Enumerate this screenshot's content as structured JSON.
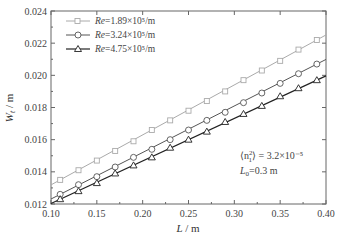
{
  "chart_data": {
    "type": "line",
    "title": "",
    "xlabel": "L / m",
    "ylabel": "W_t / m",
    "xlim": [
      0.1,
      0.4
    ],
    "ylim": [
      0.012,
      0.024
    ],
    "xticks": [
      0.1,
      0.15,
      0.2,
      0.25,
      0.3,
      0.35,
      0.4
    ],
    "xtick_labels": [
      "0.10",
      "0.15",
      "0.20",
      "0.25",
      "0.30",
      "0.35",
      "0.40"
    ],
    "yticks": [
      0.012,
      0.014,
      0.016,
      0.018,
      0.02,
      0.022,
      0.024
    ],
    "ytick_labels": [
      "0.012",
      "0.014",
      "0.016",
      "0.018",
      "0.020",
      "0.022",
      "0.024"
    ],
    "grid": false,
    "legend_position": "upper left",
    "x": [
      0.11,
      0.13,
      0.15,
      0.17,
      0.19,
      0.21,
      0.23,
      0.25,
      0.27,
      0.29,
      0.31,
      0.33,
      0.35,
      0.37,
      0.39
    ],
    "series": [
      {
        "name": "Re=1.89×10⁵/m",
        "marker": "square",
        "color": "#aaaaaa",
        "values": [
          0.0135,
          0.0141,
          0.0147,
          0.0153,
          0.0159,
          0.0166,
          0.0172,
          0.0178,
          0.0184,
          0.019,
          0.0197,
          0.0203,
          0.0209,
          0.0216,
          0.0222
        ]
      },
      {
        "name": "Re=3.24×10⁵/m",
        "marker": "circle",
        "color": "#555555",
        "values": [
          0.0126,
          0.0132,
          0.0137,
          0.0143,
          0.0149,
          0.0154,
          0.016,
          0.0166,
          0.0172,
          0.0177,
          0.0183,
          0.0189,
          0.0195,
          0.0201,
          0.0207
        ]
      },
      {
        "name": "Re=4.75×10⁵/m",
        "marker": "triangle",
        "color": "#222222",
        "values": [
          0.0123,
          0.0128,
          0.0133,
          0.0139,
          0.0144,
          0.0149,
          0.0155,
          0.016,
          0.0165,
          0.0171,
          0.0176,
          0.0181,
          0.0187,
          0.0192,
          0.0197
        ]
      }
    ],
    "annotations": [
      "⟨n₁²⟩ = 3.2×10⁻⁵",
      "L₀=0.3 m"
    ]
  },
  "legend": {
    "items": [
      {
        "prefix": "Re",
        "value": "=1.89×10⁵/m"
      },
      {
        "prefix": "Re",
        "value": "=3.24×10⁵/m"
      },
      {
        "prefix": "Re",
        "value": "=4.75×10⁵/m"
      }
    ]
  },
  "axes": {
    "xlabel_italic": "L",
    "xlabel_unit": " / m",
    "ylabel_italic": "W",
    "ylabel_sub": "t",
    "ylabel_unit": " / m"
  },
  "annotation": {
    "line1_left": "⟨n",
    "line1_sup": "2",
    "line1_sub": "1",
    "line1_right": "⟩ = 3.2×10⁻⁵",
    "line2_italic": "L",
    "line2_sub": "0",
    "line2_rest": "=0.3 m"
  }
}
